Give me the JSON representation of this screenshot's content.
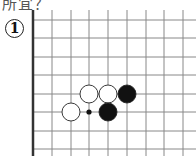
{
  "header": {
    "caption_fragment": "所宜？"
  },
  "problem": {
    "number_label": "1"
  },
  "board": {
    "edge_x": 33,
    "x_lines": [
      52,
      71,
      89,
      108,
      127,
      146,
      164,
      183
    ],
    "y_lines": [
      20,
      38,
      57,
      75,
      94,
      112,
      131,
      149
    ],
    "stones": [
      {
        "color": "white",
        "x": 89,
        "y": 94
      },
      {
        "color": "white",
        "x": 108,
        "y": 94
      },
      {
        "color": "black",
        "x": 127,
        "y": 94
      },
      {
        "color": "white",
        "x": 71,
        "y": 112
      },
      {
        "color": "black",
        "x": 108,
        "y": 112
      }
    ],
    "markers": [
      {
        "type": "dot",
        "x": 89,
        "y": 112
      }
    ],
    "colors": {
      "line": "#888888",
      "edge": "#333333",
      "black": "#111111",
      "white": "#ffffff"
    }
  }
}
